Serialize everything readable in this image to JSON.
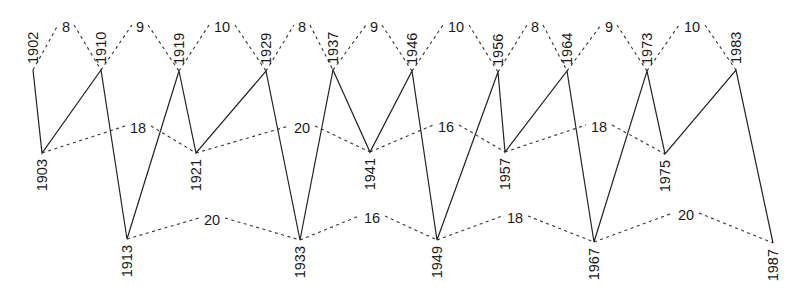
{
  "diagram": {
    "colors": {
      "line": "#222222",
      "text": "#1a1a1a",
      "background": "#ffffff"
    },
    "nodes": [
      {
        "year": "1902",
        "row": "top",
        "x": 33,
        "y": 70
      },
      {
        "year": "1903",
        "row": "middle",
        "x": 42,
        "y": 153
      },
      {
        "year": "1910",
        "row": "top",
        "x": 101,
        "y": 70
      },
      {
        "year": "1913",
        "row": "bottom",
        "x": 127,
        "y": 239
      },
      {
        "year": "1919",
        "row": "top",
        "x": 179,
        "y": 71
      },
      {
        "year": "1921",
        "row": "middle",
        "x": 196,
        "y": 153
      },
      {
        "year": "1929",
        "row": "top",
        "x": 266,
        "y": 71
      },
      {
        "year": "1933",
        "row": "bottom",
        "x": 300,
        "y": 240
      },
      {
        "year": "1937",
        "row": "top",
        "x": 333,
        "y": 70
      },
      {
        "year": "1941",
        "row": "middle",
        "x": 370,
        "y": 152
      },
      {
        "year": "1946",
        "row": "top",
        "x": 412,
        "y": 71
      },
      {
        "year": "1949",
        "row": "bottom",
        "x": 437,
        "y": 240
      },
      {
        "year": "1956",
        "row": "top",
        "x": 498,
        "y": 72
      },
      {
        "year": "1957",
        "row": "middle",
        "x": 505,
        "y": 152
      },
      {
        "year": "1964",
        "row": "top",
        "x": 567,
        "y": 71
      },
      {
        "year": "1967",
        "row": "bottom",
        "x": 594,
        "y": 242
      },
      {
        "year": "1973",
        "row": "top",
        "x": 647,
        "y": 71
      },
      {
        "year": "1975",
        "row": "middle",
        "x": 665,
        "y": 154
      },
      {
        "year": "1983",
        "row": "top",
        "x": 736,
        "y": 70
      },
      {
        "year": "1987",
        "row": "bottom",
        "x": 773,
        "y": 243
      }
    ],
    "top_intervals": [
      {
        "from": "1902",
        "to": "1910",
        "label": "8",
        "x": 66,
        "y": 27
      },
      {
        "from": "1910",
        "to": "1919",
        "label": "9",
        "x": 140,
        "y": 27
      },
      {
        "from": "1919",
        "to": "1929",
        "label": "10",
        "x": 222,
        "y": 27
      },
      {
        "from": "1929",
        "to": "1937",
        "label": "8",
        "x": 302,
        "y": 27
      },
      {
        "from": "1937",
        "to": "1946",
        "label": "9",
        "x": 374,
        "y": 27
      },
      {
        "from": "1946",
        "to": "1956",
        "label": "10",
        "x": 456,
        "y": 27
      },
      {
        "from": "1956",
        "to": "1964",
        "label": "8",
        "x": 535,
        "y": 27
      },
      {
        "from": "1964",
        "to": "1973",
        "label": "9",
        "x": 609,
        "y": 27
      },
      {
        "from": "1973",
        "to": "1983",
        "label": "10",
        "x": 692,
        "y": 27
      }
    ],
    "middle_intervals": [
      {
        "from": "1903",
        "to": "1921",
        "label": "18",
        "x": 138,
        "y": 128
      },
      {
        "from": "1921",
        "to": "1941",
        "label": "20",
        "x": 302,
        "y": 128
      },
      {
        "from": "1941",
        "to": "1957",
        "label": "16",
        "x": 446,
        "y": 127
      },
      {
        "from": "1957",
        "to": "1975",
        "label": "18",
        "x": 599,
        "y": 127
      }
    ],
    "bottom_intervals": [
      {
        "from": "1913",
        "to": "1933",
        "label": "20",
        "x": 212,
        "y": 220
      },
      {
        "from": "1933",
        "to": "1949",
        "label": "16",
        "x": 372,
        "y": 218
      },
      {
        "from": "1949",
        "to": "1967",
        "label": "18",
        "x": 515,
        "y": 218
      },
      {
        "from": "1967",
        "to": "1987",
        "label": "20",
        "x": 686,
        "y": 215
      }
    ]
  }
}
